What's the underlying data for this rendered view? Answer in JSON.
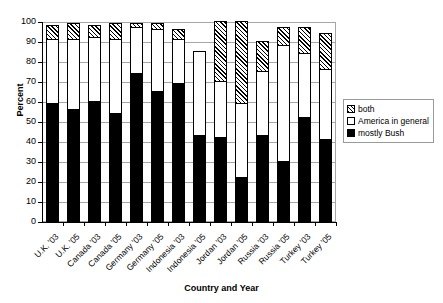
{
  "chart_data": {
    "type": "bar",
    "stacked": true,
    "title": "",
    "xlabel": "Country and Year",
    "ylabel": "Percent",
    "ylim": [
      0,
      100
    ],
    "ytick_step": 10,
    "yticks": [
      0,
      10,
      20,
      30,
      40,
      50,
      60,
      70,
      80,
      90,
      100
    ],
    "grid": true,
    "legend_position": "right",
    "categories": [
      "U.K. '03",
      "U.K. '05",
      "Canada '03",
      "Canada '05",
      "Germany '03",
      "Germany '05",
      "Indonesia '03",
      "Indonesia '05",
      "Jordan '03",
      "Jordan '05",
      "Russia '03",
      "Russia '05",
      "Turkey '03",
      "Turkey '05"
    ],
    "series": [
      {
        "name": "mostly Bush",
        "pattern": "solid-black",
        "values": [
          59,
          56,
          60,
          54,
          74,
          65,
          69,
          43,
          42,
          22,
          43,
          30,
          52,
          41
        ]
      },
      {
        "name": "America in general",
        "pattern": "white",
        "values": [
          32,
          35,
          32,
          37,
          23,
          31,
          22,
          42,
          28,
          37,
          32,
          58,
          32,
          35
        ]
      },
      {
        "name": "both",
        "pattern": "hatched",
        "values": [
          7,
          8,
          6,
          8,
          2,
          3,
          5,
          0,
          30,
          41,
          15,
          9,
          13,
          18
        ]
      }
    ],
    "cumulative_tops": {
      "mostly_bush": [
        59,
        56,
        60,
        54,
        74,
        65,
        69,
        43,
        42,
        22,
        43,
        30,
        52,
        41
      ],
      "america_in_general": [
        91,
        91,
        92,
        91,
        97,
        96,
        91,
        85,
        70,
        59,
        75,
        88,
        84,
        76
      ],
      "both": [
        98,
        99,
        98,
        99,
        99,
        99,
        96,
        85,
        100,
        100,
        90,
        97,
        97,
        94
      ]
    }
  },
  "legend": {
    "items": [
      {
        "label": "both",
        "swatch": "hatched-swatch"
      },
      {
        "label": "America in general",
        "swatch": "white-swatch"
      },
      {
        "label": "mostly Bush",
        "swatch": "black-swatch"
      }
    ]
  },
  "axes": {
    "y_title": "Percent",
    "x_title": "Country and Year"
  }
}
